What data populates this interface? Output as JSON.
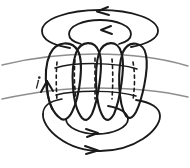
{
  "figure": {
    "title": "Torus with oriented toroidal and poloidal field lines",
    "width": 190,
    "height": 168,
    "background_color": "#ffffff",
    "ink_color": "#1a1a1a",
    "ground_curve_color": "#8e8e8e",
    "label": "i",
    "elements": {
      "top_outer_ellipse": "toroidal-loop-top-outer",
      "top_inner_ellipse": "toroidal-loop-top-inner",
      "bottom_outer_ellipse": "toroidal-loop-bottom-outer",
      "bottom_inner_ellipse": "toroidal-loop-bottom-inner",
      "vertical_loops_count": 4,
      "arrow_directions": {
        "top_outer": "left",
        "top_inner": "left",
        "bottom_inner": "right",
        "bottom_outer": "right",
        "side_loop": "up"
      }
    }
  }
}
